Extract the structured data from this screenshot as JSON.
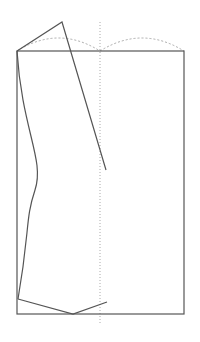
{
  "diagram": {
    "type": "pattern-drafting-sketch",
    "width": 200,
    "height": 342,
    "colors": {
      "background": "#ffffff",
      "solid_line": "#555555",
      "dashed_line": "#aaaaaa"
    },
    "frame_rect": {
      "x": 17,
      "y": 51,
      "width": 167,
      "height": 263
    },
    "center_guide": {
      "x": 100,
      "y1": 22,
      "y2": 325
    },
    "top_arcs": [
      {
        "from": [
          17,
          51
        ],
        "to": [
          100,
          51
        ],
        "peak_y": 38
      },
      {
        "from": [
          100,
          51
        ],
        "to": [
          184,
          51
        ],
        "peak_y": 38
      }
    ],
    "top_polyline": [
      [
        17,
        51
      ],
      [
        62,
        22
      ],
      [
        106,
        170
      ]
    ],
    "left_curve": {
      "start": [
        17,
        51
      ],
      "control1": [
        22,
        130
      ],
      "control2": [
        45,
        160
      ],
      "mid": [
        35,
        190
      ],
      "control3": [
        30,
        230
      ],
      "end": [
        18,
        299
      ]
    },
    "bottom_polyline": [
      [
        18,
        299
      ],
      [
        73,
        314
      ],
      [
        107,
        302
      ]
    ]
  }
}
